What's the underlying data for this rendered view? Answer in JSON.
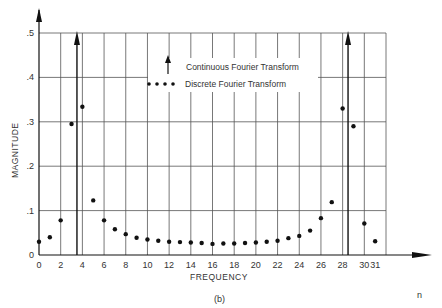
{
  "chart_data": {
    "type": "scatter",
    "title": "",
    "caption": "(b)",
    "xlabel": "FREQUENCY",
    "ylabel": "MAGNITUDE",
    "x_axis_end_label": "n",
    "xlim": [
      0,
      32
    ],
    "ylim": [
      0,
      0.5
    ],
    "grid": true,
    "x_ticks": [
      0,
      2,
      4,
      6,
      8,
      10,
      12,
      14,
      16,
      18,
      20,
      22,
      24,
      26,
      28,
      30,
      31
    ],
    "y_ticks": [
      {
        "value": 0,
        "label": "0"
      },
      {
        "value": 0.1,
        "label": ".1"
      },
      {
        "value": 0.2,
        "label": ".2"
      },
      {
        "value": 0.3,
        "label": ".3"
      },
      {
        "value": 0.4,
        "label": ".4"
      },
      {
        "value": 0.5,
        "label": ".5"
      }
    ],
    "legend": [
      {
        "marker": "arrow",
        "label": "Continuous Fourier Transform"
      },
      {
        "marker": "dots",
        "label": "Discrete Fourier Transform"
      }
    ],
    "series": [
      {
        "name": "Continuous Fourier Transform",
        "kind": "impulse",
        "x": [
          3.5,
          28.5
        ],
        "note": "impulses (arrows) extend beyond top of plot"
      },
      {
        "name": "Discrete Fourier Transform",
        "kind": "points",
        "x": [
          0,
          1,
          2,
          3,
          4,
          5,
          6,
          7,
          8,
          9,
          10,
          11,
          12,
          13,
          14,
          15,
          16,
          17,
          18,
          19,
          20,
          21,
          22,
          23,
          24,
          25,
          26,
          27,
          28,
          29,
          30,
          31
        ],
        "values": [
          0.03,
          0.04,
          0.078,
          0.295,
          0.334,
          0.123,
          0.078,
          0.058,
          0.047,
          0.039,
          0.035,
          0.032,
          0.03,
          0.029,
          0.028,
          0.027,
          0.025,
          0.026,
          0.026,
          0.027,
          0.028,
          0.03,
          0.032,
          0.038,
          0.043,
          0.055,
          0.083,
          0.119,
          0.33,
          0.29,
          0.071,
          0.031
        ]
      }
    ]
  }
}
